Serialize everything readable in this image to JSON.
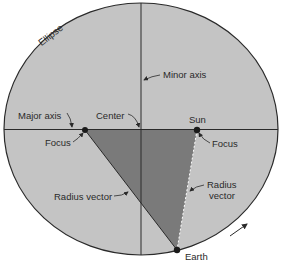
{
  "diagram": {
    "title_label": "Ellipse",
    "labels": {
      "minor_axis": "Minor axis",
      "major_axis": "Major axis",
      "center": "Center",
      "sun": "Sun",
      "focus_left": "Focus",
      "focus_right": "Focus",
      "radius_vector_left": "Radius vector",
      "radius_vector_right_line1": "Radius",
      "radius_vector_right_line2": "vector",
      "earth": "Earth"
    },
    "colors": {
      "ellipse_fill": "#c4c4c4",
      "triangle_fill": "#7a7a7a",
      "stroke": "#2a2a2a"
    },
    "orbit_direction": "counterclockwise arrow near Earth"
  }
}
